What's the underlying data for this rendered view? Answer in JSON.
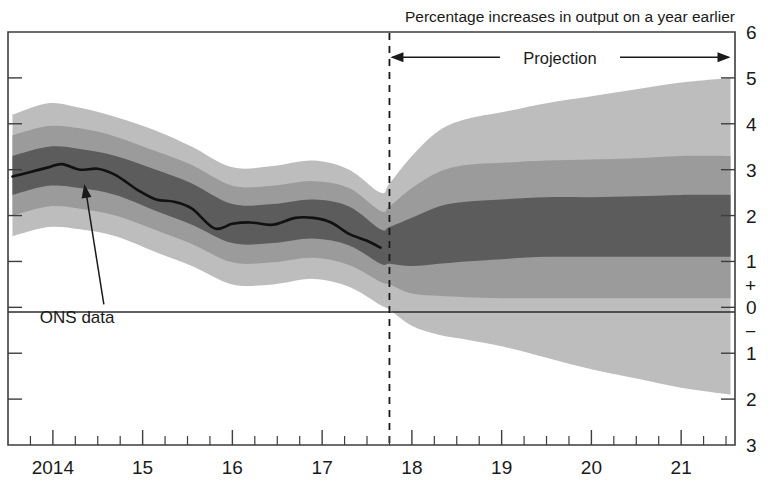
{
  "chart_data": {
    "type": "area",
    "title": "Percentage increases in output on a year earlier",
    "subtitle": "",
    "xlabel": "",
    "ylabel": "",
    "xlim": [
      2013.5,
      2021.6
    ],
    "ylim": [
      -3,
      6
    ],
    "y_ticks": [
      6,
      5,
      4,
      3,
      2,
      1,
      0,
      -1,
      -2,
      -3
    ],
    "y_tick_labels": [
      "6",
      "5",
      "4",
      "3",
      "2",
      "1",
      "0",
      "1",
      "2",
      "3"
    ],
    "y_axis_position": "right",
    "positive_sign": "+",
    "negative_sign": "−",
    "x_ticks": [
      2014,
      2015,
      2016,
      2017,
      2018,
      2019,
      2020,
      2021
    ],
    "x_tick_labels": [
      "2014",
      "15",
      "16",
      "17",
      "18",
      "19",
      "20",
      "21"
    ],
    "x_minor_tick_interval_years": 0.25,
    "grid": false,
    "legend": "none",
    "projection_start_x": 2017.75,
    "annotations": [
      {
        "name": "projection-label",
        "text": "Projection",
        "x_start": 2017.75,
        "x_end": 2021.55,
        "y": 5.45,
        "style": "double-headed-arrow"
      },
      {
        "name": "ons-data-label",
        "text": "ONS data",
        "x": 2014.1,
        "y": -0.35,
        "points_to_x": 2014.35,
        "points_to_y": 2.95
      }
    ],
    "band_colors": {
      "outer": "#bdbdbd",
      "middle": "#9b9b9b",
      "inner": "#5c5c5c",
      "central_line": "#111111",
      "background": "#ffffff"
    },
    "band_labels": {
      "outer": "90% probability interval",
      "middle": "60% probability interval",
      "inner": "30% probability interval",
      "central_line": "ONS data / central projection"
    },
    "series": [
      {
        "name": "central",
        "label": "ONS data",
        "x": [
          2013.55,
          2013.75,
          2013.95,
          2014.1,
          2014.3,
          2014.5,
          2014.7,
          2014.95,
          2015.15,
          2015.35,
          2015.55,
          2015.8,
          2016.0,
          2016.2,
          2016.45,
          2016.7,
          2016.9,
          2017.1,
          2017.3,
          2017.5,
          2017.65
        ],
        "values": [
          2.85,
          2.95,
          3.05,
          3.12,
          3.0,
          3.02,
          2.88,
          2.55,
          2.35,
          2.3,
          2.15,
          1.72,
          1.82,
          1.85,
          1.8,
          1.95,
          1.95,
          1.85,
          1.6,
          1.45,
          1.3
        ]
      },
      {
        "name": "inner_upper",
        "label": "30% upper",
        "x": [
          2013.55,
          2013.95,
          2014.3,
          2014.7,
          2015.15,
          2015.55,
          2016.0,
          2016.45,
          2016.9,
          2017.3,
          2017.65,
          2017.75,
          2018.0,
          2018.3,
          2018.6,
          2019.0,
          2019.5,
          2020.0,
          2020.5,
          2021.0,
          2021.55
        ],
        "values": [
          3.3,
          3.5,
          3.45,
          3.3,
          3.0,
          2.7,
          2.25,
          2.25,
          2.35,
          2.2,
          1.7,
          1.75,
          1.95,
          2.2,
          2.3,
          2.35,
          2.4,
          2.4,
          2.42,
          2.45,
          2.45
        ]
      },
      {
        "name": "inner_lower",
        "label": "30% lower",
        "x": [
          2013.55,
          2013.95,
          2014.3,
          2014.7,
          2015.15,
          2015.55,
          2016.0,
          2016.45,
          2016.9,
          2017.3,
          2017.65,
          2017.75,
          2018.0,
          2018.3,
          2018.6,
          2019.0,
          2019.5,
          2020.0,
          2020.5,
          2021.0,
          2021.55
        ],
        "values": [
          2.45,
          2.65,
          2.6,
          2.45,
          2.1,
          1.8,
          1.4,
          1.4,
          1.5,
          1.35,
          0.95,
          0.95,
          0.9,
          0.95,
          1.0,
          1.05,
          1.1,
          1.1,
          1.1,
          1.1,
          1.1
        ]
      },
      {
        "name": "middle_upper",
        "label": "60% upper",
        "x": [
          2013.55,
          2013.95,
          2014.3,
          2014.7,
          2015.15,
          2015.55,
          2016.0,
          2016.45,
          2016.9,
          2017.3,
          2017.65,
          2017.75,
          2018.0,
          2018.3,
          2018.6,
          2019.0,
          2019.5,
          2020.0,
          2020.5,
          2021.0,
          2021.55
        ],
        "values": [
          3.75,
          3.95,
          3.9,
          3.72,
          3.4,
          3.1,
          2.65,
          2.65,
          2.75,
          2.6,
          2.1,
          2.2,
          2.6,
          2.95,
          3.1,
          3.15,
          3.2,
          3.22,
          3.25,
          3.3,
          3.3
        ]
      },
      {
        "name": "middle_lower",
        "label": "60% lower",
        "x": [
          2013.55,
          2013.95,
          2014.3,
          2014.7,
          2015.15,
          2015.55,
          2016.0,
          2016.45,
          2016.9,
          2017.3,
          2017.65,
          2017.75,
          2018.0,
          2018.3,
          2018.6,
          2019.0,
          2019.5,
          2020.0,
          2020.5,
          2021.0,
          2021.55
        ],
        "values": [
          2.0,
          2.2,
          2.15,
          2.0,
          1.68,
          1.38,
          0.98,
          0.98,
          1.08,
          0.92,
          0.55,
          0.5,
          0.3,
          0.25,
          0.22,
          0.2,
          0.2,
          0.2,
          0.2,
          0.2,
          0.2
        ]
      },
      {
        "name": "outer_upper",
        "label": "90% upper",
        "x": [
          2013.55,
          2013.95,
          2014.3,
          2014.7,
          2015.15,
          2015.55,
          2016.0,
          2016.45,
          2016.9,
          2017.3,
          2017.65,
          2017.75,
          2018.0,
          2018.3,
          2018.6,
          2019.0,
          2019.5,
          2020.0,
          2020.5,
          2021.0,
          2021.55
        ],
        "values": [
          4.2,
          4.45,
          4.35,
          4.15,
          3.85,
          3.5,
          3.05,
          3.08,
          3.2,
          3.0,
          2.5,
          2.7,
          3.3,
          3.85,
          4.1,
          4.25,
          4.45,
          4.6,
          4.75,
          4.9,
          5.0
        ]
      },
      {
        "name": "outer_lower",
        "label": "90% lower",
        "x": [
          2013.55,
          2013.95,
          2014.3,
          2014.7,
          2015.15,
          2015.55,
          2016.0,
          2016.45,
          2016.9,
          2017.3,
          2017.65,
          2017.75,
          2018.0,
          2018.3,
          2018.6,
          2019.0,
          2019.5,
          2020.0,
          2020.5,
          2021.0,
          2021.55
        ],
        "values": [
          1.55,
          1.75,
          1.7,
          1.55,
          1.2,
          0.9,
          0.5,
          0.5,
          0.62,
          0.45,
          0.05,
          -0.05,
          -0.4,
          -0.6,
          -0.7,
          -0.85,
          -1.1,
          -1.35,
          -1.55,
          -1.75,
          -1.9
        ]
      }
    ]
  }
}
